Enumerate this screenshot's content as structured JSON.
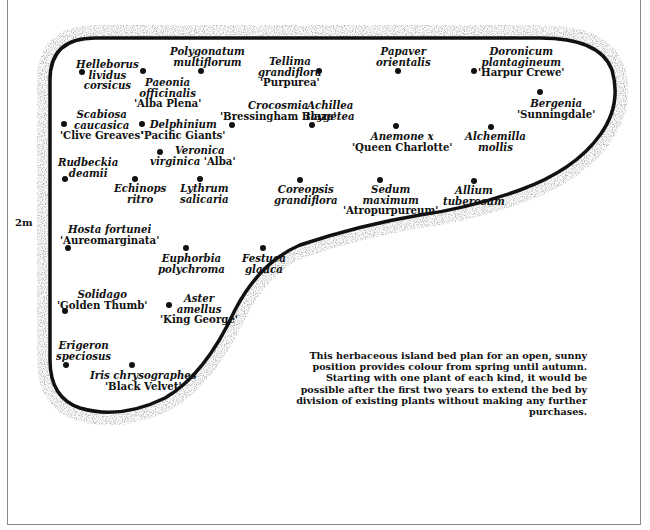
{
  "diagram": {
    "title": "Herbaceous island bed plan",
    "scale_label": "2m",
    "caption": "This herbaceous island bed plan for an open, sunny position provides colour from spring until autumn. Starting with one plant of each kind, it would be possible after the first two years to extend the bed by division of existing plants without making any further purchases.",
    "colors": {
      "ink": "#111111",
      "frame": "#8a8a8a",
      "background": "#ffffff"
    },
    "plants": [
      {
        "id": "helleborus",
        "lines": [
          "Helleborus",
          "lividus",
          "corsicus"
        ],
        "cultivar": ""
      },
      {
        "id": "paeonia",
        "lines": [
          "Paeonia",
          "officinalis"
        ],
        "cultivar": "'Alba Plena'"
      },
      {
        "id": "polygonatum",
        "lines": [
          "Polygonatum",
          "multiflorum"
        ],
        "cultivar": ""
      },
      {
        "id": "tellima",
        "lines": [
          "Tellima",
          "grandiflora"
        ],
        "cultivar": "'Purpurea'"
      },
      {
        "id": "papaver",
        "lines": [
          "Papaver",
          "orientalis"
        ],
        "cultivar": ""
      },
      {
        "id": "doronicum",
        "lines": [
          "Doronicum",
          "plantagineum"
        ],
        "cultivar": "'Harpur Crewe'"
      },
      {
        "id": "bergenia",
        "lines": [
          "Bergenia"
        ],
        "cultivar": "'Sunningdale'"
      },
      {
        "id": "scabiosa",
        "lines": [
          "Scabiosa",
          "caucasica"
        ],
        "cultivar": "'Clive Greaves'"
      },
      {
        "id": "delphinium",
        "lines": [
          "Delphinium"
        ],
        "cultivar": "'Pacific Giants'"
      },
      {
        "id": "crocosmia",
        "lines": [
          "Crocosmia"
        ],
        "cultivar": "'Bressingham Blaze'"
      },
      {
        "id": "achillea",
        "lines": [
          "Achillea",
          "taygetea"
        ],
        "cultivar": ""
      },
      {
        "id": "anemone",
        "lines": [
          "Anemone x"
        ],
        "cultivar": "'Queen Charlotte'"
      },
      {
        "id": "alchemilla",
        "lines": [
          "Alchemilla",
          "mollis"
        ],
        "cultivar": ""
      },
      {
        "id": "veronica",
        "lines": [
          "Veronica",
          "virginica"
        ],
        "cultivar": "'Alba'"
      },
      {
        "id": "rudbeckia",
        "lines": [
          "Rudbeckia",
          "deamii"
        ],
        "cultivar": ""
      },
      {
        "id": "echinops",
        "lines": [
          "Echinops",
          "ritro"
        ],
        "cultivar": ""
      },
      {
        "id": "lythrum",
        "lines": [
          "Lythrum",
          "salicaria"
        ],
        "cultivar": ""
      },
      {
        "id": "coreopsis",
        "lines": [
          "Coreopsis",
          "grandiflora"
        ],
        "cultivar": ""
      },
      {
        "id": "sedum",
        "lines": [
          "Sedum",
          "maximum"
        ],
        "cultivar": "'Atropurpureum'"
      },
      {
        "id": "allium",
        "lines": [
          "Allium",
          "tuberosum"
        ],
        "cultivar": ""
      },
      {
        "id": "hosta",
        "lines": [
          "Hosta fortunei"
        ],
        "cultivar": "'Aureomarginata'"
      },
      {
        "id": "euphorbia",
        "lines": [
          "Euphorbia",
          "polychroma"
        ],
        "cultivar": ""
      },
      {
        "id": "festuca",
        "lines": [
          "Festuca",
          "glauca"
        ],
        "cultivar": ""
      },
      {
        "id": "solidago",
        "lines": [
          "Solidago"
        ],
        "cultivar": "'Golden Thumb'"
      },
      {
        "id": "aster",
        "lines": [
          "Aster",
          "amellus"
        ],
        "cultivar": "'King George'"
      },
      {
        "id": "erigeron",
        "lines": [
          "Erigeron",
          "speciosus"
        ],
        "cultivar": ""
      },
      {
        "id": "iris",
        "lines": [
          "Iris chrysographes"
        ],
        "cultivar": "'Black Velvet'"
      }
    ]
  }
}
